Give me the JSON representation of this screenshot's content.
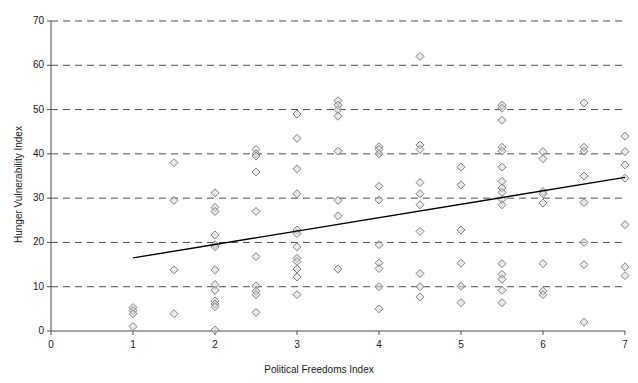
{
  "chart_data": {
    "type": "scatter",
    "title": "",
    "xlabel": "Political Freedoms Index",
    "ylabel": "Hunger Vulnerability Index",
    "xlim": [
      0,
      7
    ],
    "ylim": [
      0,
      70
    ],
    "xticks": [
      0,
      1,
      2,
      3,
      4,
      5,
      6,
      7
    ],
    "yticks": [
      0,
      10,
      20,
      30,
      40,
      50,
      60,
      70
    ],
    "xtick_labels": [
      "0",
      "1",
      "2",
      "3",
      "4",
      "5",
      "6",
      "7"
    ],
    "ytick_labels": [
      "0",
      "10",
      "20",
      "30",
      "40",
      "50",
      "60",
      "70"
    ],
    "grid": {
      "horizontal": true,
      "vertical": false,
      "style": "dashed",
      "color": "#4d4d4d"
    },
    "legend": {
      "visible": false,
      "position": "none"
    },
    "marker": {
      "shape": "diamond",
      "filled": false,
      "edge_color": "#808080",
      "fill_color": "#d9d9d9",
      "size": 4
    },
    "series": [
      {
        "name": "Countries",
        "points": [
          [
            1.0,
            5.3
          ],
          [
            1.0,
            4.6
          ],
          [
            1.0,
            3.9
          ],
          [
            1.0,
            1.0
          ],
          [
            1.5,
            38.0
          ],
          [
            1.5,
            29.5
          ],
          [
            1.5,
            13.8
          ],
          [
            1.5,
            3.9
          ],
          [
            2.0,
            31.2
          ],
          [
            2.0,
            27.9
          ],
          [
            2.0,
            27.0
          ],
          [
            2.0,
            21.7
          ],
          [
            2.0,
            19.5
          ],
          [
            2.0,
            19.0
          ],
          [
            2.0,
            13.8
          ],
          [
            2.0,
            10.5
          ],
          [
            2.0,
            9.2
          ],
          [
            2.0,
            6.8
          ],
          [
            2.0,
            6.1
          ],
          [
            2.0,
            5.5
          ],
          [
            2.0,
            0.2
          ],
          [
            2.5,
            41.0
          ],
          [
            2.5,
            40.0
          ],
          [
            2.5,
            39.5
          ],
          [
            2.5,
            35.9
          ],
          [
            2.5,
            27.0
          ],
          [
            2.5,
            16.8
          ],
          [
            2.5,
            10.2
          ],
          [
            2.5,
            9.0
          ],
          [
            2.5,
            8.2
          ],
          [
            2.5,
            4.2
          ],
          [
            3.0,
            49.0
          ],
          [
            3.0,
            43.5
          ],
          [
            3.0,
            36.6
          ],
          [
            3.0,
            31.0
          ],
          [
            3.0,
            22.8
          ],
          [
            3.0,
            22.0
          ],
          [
            3.0,
            19.0
          ],
          [
            3.0,
            16.4
          ],
          [
            3.0,
            15.7
          ],
          [
            3.0,
            14.0
          ],
          [
            3.0,
            12.2
          ],
          [
            3.0,
            8.2
          ],
          [
            3.5,
            52.0
          ],
          [
            3.5,
            51.0
          ],
          [
            3.5,
            50.0
          ],
          [
            3.5,
            48.5
          ],
          [
            3.5,
            40.6
          ],
          [
            3.5,
            29.5
          ],
          [
            3.5,
            26.0
          ],
          [
            3.5,
            14.0
          ],
          [
            4.0,
            41.6
          ],
          [
            4.0,
            41.0
          ],
          [
            4.0,
            40.0
          ],
          [
            4.0,
            32.7
          ],
          [
            4.0,
            29.6
          ],
          [
            4.0,
            19.5
          ],
          [
            4.0,
            15.4
          ],
          [
            4.0,
            14.1
          ],
          [
            4.0,
            10.0
          ],
          [
            4.0,
            5.0
          ],
          [
            4.5,
            62.0
          ],
          [
            4.5,
            42.0
          ],
          [
            4.5,
            41.0
          ],
          [
            4.5,
            33.5
          ],
          [
            4.5,
            31.0
          ],
          [
            4.5,
            28.5
          ],
          [
            4.5,
            22.5
          ],
          [
            4.5,
            13.0
          ],
          [
            4.5,
            10.0
          ],
          [
            4.5,
            7.7
          ],
          [
            5.0,
            37.0
          ],
          [
            5.0,
            33.0
          ],
          [
            5.0,
            22.8
          ],
          [
            5.0,
            15.3
          ],
          [
            5.0,
            10.1
          ],
          [
            5.0,
            6.4
          ],
          [
            5.5,
            51.0
          ],
          [
            5.5,
            50.3
          ],
          [
            5.5,
            47.6
          ],
          [
            5.5,
            41.5
          ],
          [
            5.5,
            40.6
          ],
          [
            5.5,
            37.0
          ],
          [
            5.5,
            33.8
          ],
          [
            5.5,
            32.3
          ],
          [
            5.5,
            31.3
          ],
          [
            5.5,
            29.7
          ],
          [
            5.5,
            28.5
          ],
          [
            5.5,
            15.2
          ],
          [
            5.5,
            12.8
          ],
          [
            5.5,
            11.7
          ],
          [
            5.5,
            9.2
          ],
          [
            5.5,
            6.4
          ],
          [
            6.0,
            40.5
          ],
          [
            6.0,
            38.9
          ],
          [
            6.0,
            31.5
          ],
          [
            6.0,
            31.0
          ],
          [
            6.0,
            28.9
          ],
          [
            6.0,
            15.2
          ],
          [
            6.0,
            9.0
          ],
          [
            6.0,
            8.2
          ],
          [
            6.5,
            51.5
          ],
          [
            6.5,
            41.5
          ],
          [
            6.5,
            40.6
          ],
          [
            6.5,
            35.0
          ],
          [
            6.5,
            29.0
          ],
          [
            6.5,
            20.0
          ],
          [
            6.5,
            15.0
          ],
          [
            6.5,
            2.0
          ],
          [
            7.0,
            44.0
          ],
          [
            7.0,
            40.5
          ],
          [
            7.0,
            37.5
          ],
          [
            7.0,
            34.5
          ],
          [
            7.0,
            24.0
          ],
          [
            7.0,
            14.5
          ],
          [
            7.0,
            12.5
          ]
        ]
      }
    ],
    "trendline": {
      "visible": true,
      "color": "#000000",
      "x_start": 1.0,
      "y_start": 16.5,
      "x_end": 7.0,
      "y_end": 34.7
    }
  }
}
